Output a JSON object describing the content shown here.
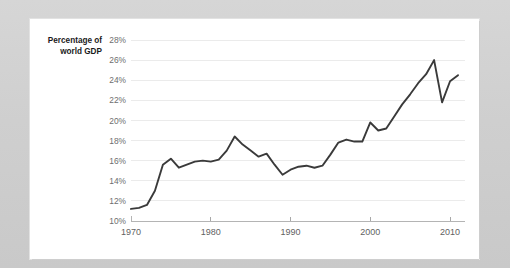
{
  "page": {
    "background_color": "#d2d2d2",
    "card_color": "#ffffff"
  },
  "chart_data": {
    "type": "line",
    "title": "",
    "axis_title_line1": "Percentage of",
    "axis_title_line2": "world GDP",
    "xlabel": "",
    "ylabel": "Percentage of world GDP",
    "grid": true,
    "legend": "none",
    "line_color": "#3a3a3a",
    "xlim": [
      1970,
      2012
    ],
    "ylim": [
      10,
      28
    ],
    "xticks": [
      1970,
      1980,
      1990,
      2000,
      2010
    ],
    "xtick_labels": [
      "1970",
      "1980",
      "1990",
      "2000",
      "2010"
    ],
    "yticks": [
      10,
      12,
      14,
      16,
      18,
      20,
      22,
      24,
      26,
      28
    ],
    "ytick_labels": [
      "10%",
      "12%",
      "14%",
      "16%",
      "18%",
      "20%",
      "22%",
      "24%",
      "26%",
      "28%"
    ],
    "x": [
      1970,
      1971,
      1972,
      1973,
      1974,
      1975,
      1976,
      1977,
      1978,
      1979,
      1980,
      1981,
      1982,
      1983,
      1984,
      1985,
      1986,
      1987,
      1988,
      1989,
      1990,
      1991,
      1992,
      1993,
      1994,
      1995,
      1996,
      1997,
      1998,
      1999,
      2000,
      2001,
      2002,
      2003,
      2004,
      2005,
      2006,
      2007,
      2008,
      2009,
      2010,
      2011
    ],
    "values": [
      11.2,
      11.3,
      11.6,
      13.0,
      15.6,
      16.2,
      15.3,
      15.6,
      15.9,
      16.0,
      15.9,
      16.1,
      17.0,
      18.4,
      17.6,
      17.0,
      16.4,
      16.7,
      15.6,
      14.6,
      15.1,
      15.4,
      15.5,
      15.3,
      15.5,
      16.6,
      17.8,
      18.1,
      17.9,
      17.9,
      19.8,
      19.0,
      19.2,
      20.4,
      21.6,
      22.6,
      23.7,
      24.6,
      26.0,
      21.8,
      23.9,
      24.5
    ]
  }
}
